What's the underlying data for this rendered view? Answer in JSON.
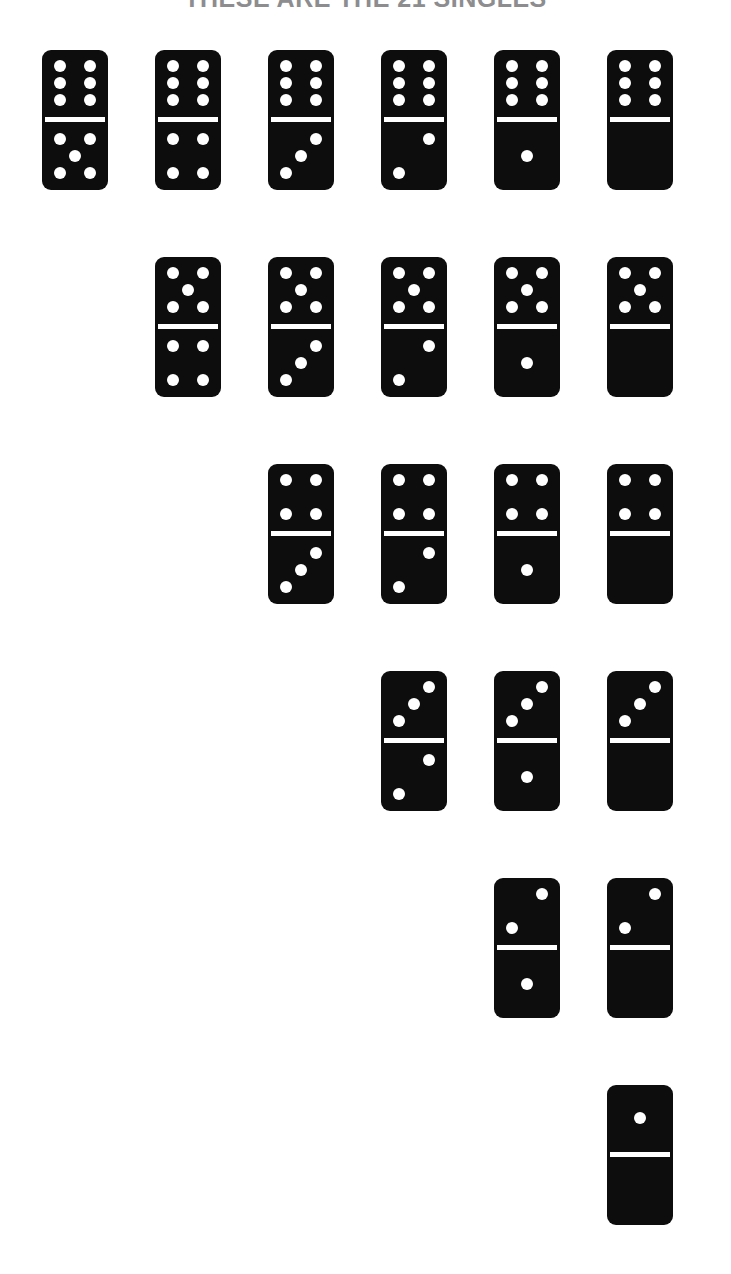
{
  "page": {
    "title": "THESE ARE THE 21 SINGLES",
    "background_color": "#ffffff",
    "tile_color": "#0d0d0d",
    "pip_color": "#ffffff",
    "title_color": "#8d8d90"
  },
  "layout": {
    "tile_width": 66,
    "tile_height": 140,
    "column_pitch": 113,
    "row_pitch": 207,
    "first_column_x": 42,
    "first_row_y": 50,
    "columns": 6,
    "alignment": "right"
  },
  "dominoes": {
    "total_count": 21,
    "rows": [
      {
        "row_index": 0,
        "start_column": 0,
        "tiles": [
          {
            "top": 6,
            "bottom": 5,
            "label": "6-5"
          },
          {
            "top": 6,
            "bottom": 4,
            "label": "6-4"
          },
          {
            "top": 6,
            "bottom": 3,
            "label": "6-3"
          },
          {
            "top": 6,
            "bottom": 2,
            "label": "6-2"
          },
          {
            "top": 6,
            "bottom": 1,
            "label": "6-1"
          },
          {
            "top": 6,
            "bottom": 0,
            "label": "6-0"
          }
        ]
      },
      {
        "row_index": 1,
        "start_column": 1,
        "tiles": [
          {
            "top": 5,
            "bottom": 4,
            "label": "5-4"
          },
          {
            "top": 5,
            "bottom": 3,
            "label": "5-3"
          },
          {
            "top": 5,
            "bottom": 2,
            "label": "5-2"
          },
          {
            "top": 5,
            "bottom": 1,
            "label": "5-1"
          },
          {
            "top": 5,
            "bottom": 0,
            "label": "5-0"
          }
        ]
      },
      {
        "row_index": 2,
        "start_column": 2,
        "tiles": [
          {
            "top": 4,
            "bottom": 3,
            "label": "4-3"
          },
          {
            "top": 4,
            "bottom": 2,
            "label": "4-2"
          },
          {
            "top": 4,
            "bottom": 1,
            "label": "4-1"
          },
          {
            "top": 4,
            "bottom": 0,
            "label": "4-0"
          }
        ]
      },
      {
        "row_index": 3,
        "start_column": 3,
        "tiles": [
          {
            "top": 3,
            "bottom": 2,
            "label": "3-2"
          },
          {
            "top": 3,
            "bottom": 1,
            "label": "3-1"
          },
          {
            "top": 3,
            "bottom": 0,
            "label": "3-0"
          }
        ]
      },
      {
        "row_index": 4,
        "start_column": 4,
        "tiles": [
          {
            "top": 2,
            "bottom": 1,
            "label": "2-1"
          },
          {
            "top": 2,
            "bottom": 0,
            "label": "2-0"
          }
        ]
      },
      {
        "row_index": 5,
        "start_column": 5,
        "tiles": [
          {
            "top": 1,
            "bottom": 0,
            "label": "1-0"
          }
        ]
      }
    ]
  }
}
